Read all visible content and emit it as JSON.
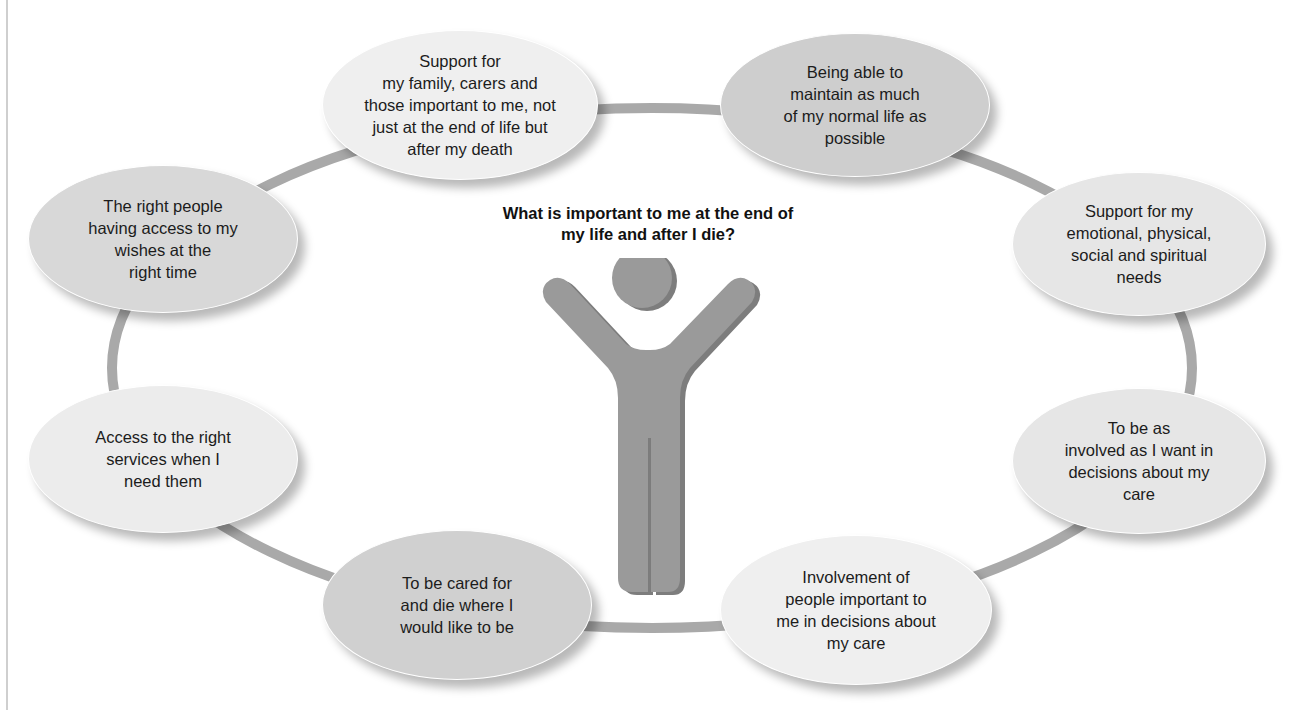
{
  "diagram": {
    "title": "What is important to me at the end of\nmy life and after I die?",
    "center_icon": "person-arms-raised-icon",
    "colors": {
      "ring": "#a9a9a9",
      "figure": "#9a9a9a",
      "figure_shadow": "#7d7d7d",
      "text": "#1c1c1c"
    },
    "bubbles": [
      {
        "id": "family-support",
        "text": "Support for\nmy family, carers and\nthose important to me, not\njust at the end of life but\nafter my death",
        "fill": "#efefef"
      },
      {
        "id": "normal-life",
        "text": "Being able to\nmaintain as much\nof my normal life as\npossible",
        "fill": "#cecece"
      },
      {
        "id": "holistic-needs",
        "text": "Support for my\nemotional, physical,\nsocial and spiritual\nneeds",
        "fill": "#e6e6e6"
      },
      {
        "id": "involved-decisions",
        "text": "To be as\ninvolved as I want in\ndecisions about my\ncare",
        "fill": "#e6e6e6"
      },
      {
        "id": "people-involvement",
        "text": "Involvement of\npeople important to\nme in decisions about\nmy care",
        "fill": "#efefef"
      },
      {
        "id": "place-of-care",
        "text": "To be cared for\nand die where I\nwould like to be",
        "fill": "#d0d0d0"
      },
      {
        "id": "access-services",
        "text": "Access to the right\nservices when I\nneed them",
        "fill": "#ececec"
      },
      {
        "id": "access-wishes",
        "text": "The right people\nhaving access to my\nwishes at the\nright time",
        "fill": "#d8d8d8"
      }
    ]
  }
}
